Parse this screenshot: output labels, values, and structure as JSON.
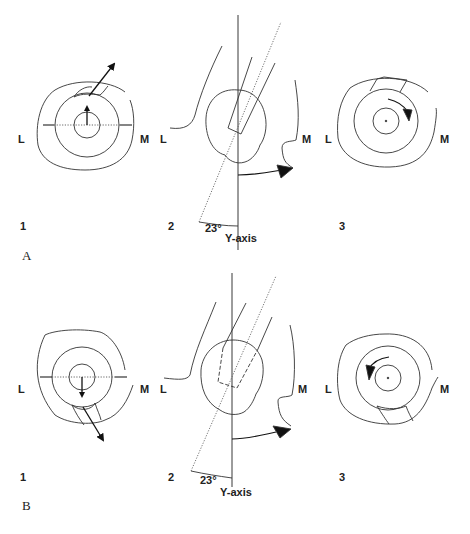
{
  "figure": {
    "rows": [
      {
        "panel_label": "A",
        "views": [
          {
            "number": "1",
            "left_label": "L",
            "right_label": "M",
            "arrow_direction": "up"
          },
          {
            "number": "2",
            "left_label": "L",
            "right_label": "M",
            "angle_label": "23°",
            "axis_label": "Y-axis"
          },
          {
            "number": "3",
            "left_label": "L",
            "right_label": "M",
            "rotation": "clockwise"
          }
        ]
      },
      {
        "panel_label": "B",
        "views": [
          {
            "number": "1",
            "left_label": "L",
            "right_label": "M",
            "arrow_direction": "down"
          },
          {
            "number": "2",
            "left_label": "L",
            "right_label": "M",
            "angle_label": "23°",
            "axis_label": "Y-axis"
          },
          {
            "number": "3",
            "left_label": "L",
            "right_label": "M",
            "rotation": "counterclockwise"
          }
        ]
      }
    ]
  }
}
